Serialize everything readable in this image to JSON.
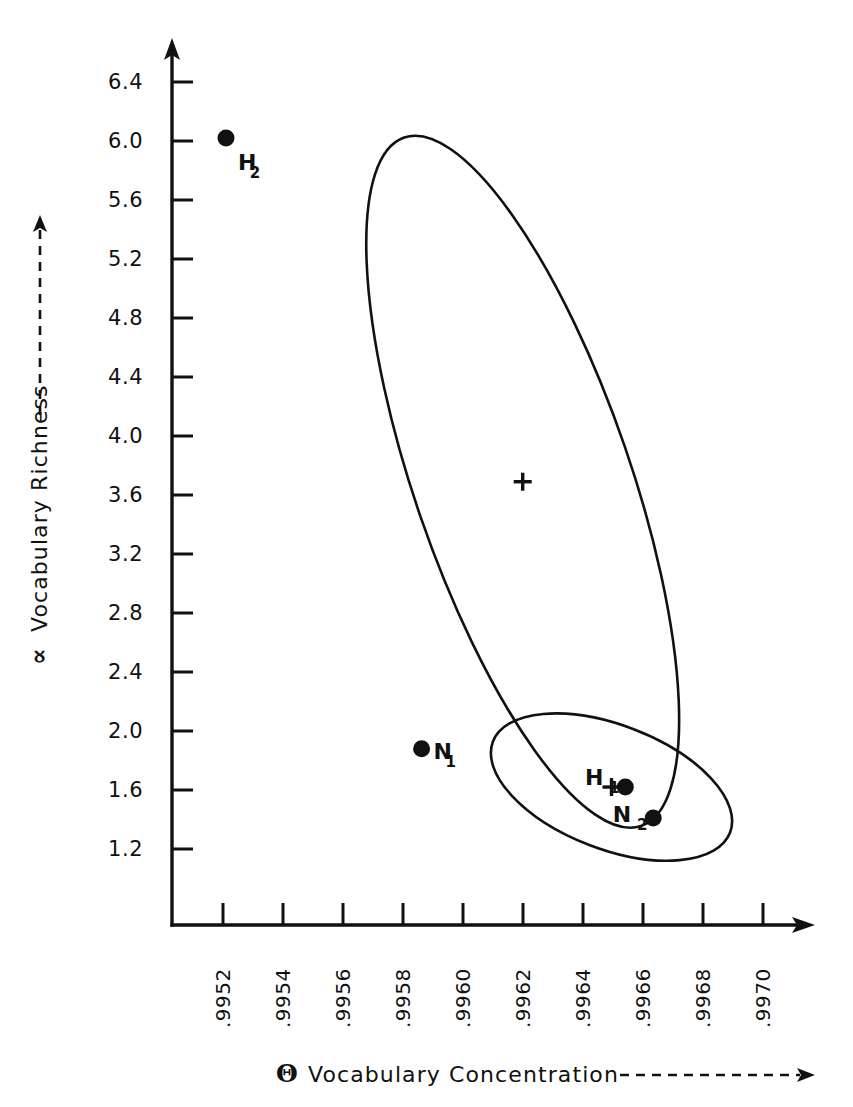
{
  "chart_data": {
    "type": "scatter",
    "title": "",
    "xlabel": "Vocabulary Concentration",
    "ylabel": "Vocabulary Richness",
    "xlabel_symbol": "Θ",
    "ylabel_symbol": "∝",
    "xlim": [
      0.99515,
      0.99715
    ],
    "ylim": [
      1.0,
      6.6
    ],
    "grid": false,
    "legend": "none",
    "xticks": [
      ".9952",
      ".9954",
      ".9956",
      ".9958",
      ".9960",
      ".9962",
      ".9964",
      ".9966",
      ".9968",
      ".9970"
    ],
    "xtick_values": [
      0.9952,
      0.9954,
      0.9956,
      0.9958,
      0.996,
      0.9962,
      0.9964,
      0.9966,
      0.9968,
      0.997
    ],
    "yticks": [
      "6.4",
      "6.0",
      "5.6",
      "5.2",
      "4.8",
      "4.4",
      "4.0",
      "3.6",
      "3.2",
      "2.8",
      "2.4",
      "2.0",
      "1.6",
      "1.2"
    ],
    "ytick_values": [
      6.4,
      6.0,
      5.6,
      5.2,
      4.8,
      4.4,
      4.0,
      3.6,
      3.2,
      2.8,
      2.4,
      2.0,
      1.6,
      1.2
    ],
    "points": [
      {
        "label": "H",
        "subscript": "2",
        "x": 0.99521,
        "y": 6.02
      },
      {
        "label": "N",
        "subscript": "1",
        "x": 0.995862,
        "y": 1.88
      },
      {
        "label": "H",
        "subscript": "1",
        "x": 0.996541,
        "y": 1.62
      },
      {
        "label": "N",
        "subscript": "2",
        "x": 0.996634,
        "y": 1.41
      }
    ],
    "centroids": [
      {
        "name": "upper-group-centroid",
        "x": 0.996199,
        "y": 3.69
      },
      {
        "name": "lower-group-centroid",
        "x": 0.996495,
        "y": 1.62
      }
    ],
    "ellipses": [
      {
        "name": "upper-confidence-ellipse",
        "center_x": 0.996199,
        "center_y": 3.69,
        "semi_major_px": 364,
        "semi_minor_px": 108,
        "rotation_deg": 71
      },
      {
        "name": "lower-confidence-ellipse",
        "center_x": 0.996495,
        "center_y": 1.62,
        "semi_major_px": 127,
        "semi_minor_px": 62,
        "rotation_deg": 21
      }
    ]
  },
  "axes": {
    "y_axis_title": "Vocabulary Richness",
    "y_axis_symbol": "∝",
    "x_axis_title": "Vocabulary Concentration",
    "x_axis_symbol": "Θ"
  },
  "colors": {
    "ink": "#111111",
    "background": "#ffffff"
  }
}
